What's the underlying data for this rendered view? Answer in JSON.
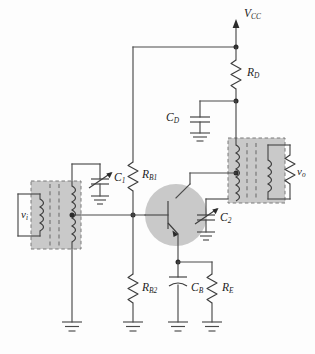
{
  "diagram": {
    "type": "electronic-circuit-schematic",
    "background_color": "#fdfdfd",
    "wire_color": "#4a4a4a",
    "shade_color": "#c9c9c9"
  },
  "labels": {
    "supply": {
      "base": "V",
      "sub": "CC"
    },
    "rd": {
      "base": "R",
      "sub": "D"
    },
    "cd": {
      "base": "C",
      "sub": "D"
    },
    "rb1": {
      "base": "R",
      "sub": "B1"
    },
    "rb2": {
      "base": "R",
      "sub": "B2"
    },
    "re": {
      "base": "R",
      "sub": "E"
    },
    "cb": {
      "base": "C",
      "sub": "B"
    },
    "c1": {
      "base": "C",
      "sub": "1"
    },
    "c2": {
      "base": "C",
      "sub": "2"
    },
    "vi": {
      "base": "v",
      "sub": "i"
    },
    "vo": {
      "base": "v",
      "sub": "o"
    }
  },
  "components": [
    {
      "id": "supply-rail",
      "name": "VCC supply rail",
      "kind": "supply-arrow"
    },
    {
      "id": "rd",
      "name": "RD collector load resistor",
      "kind": "resistor"
    },
    {
      "id": "cd",
      "name": "CD decoupling capacitor",
      "kind": "capacitor"
    },
    {
      "id": "rb1",
      "name": "RB1 upper bias resistor",
      "kind": "resistor"
    },
    {
      "id": "rb2",
      "name": "RB2 lower bias resistor",
      "kind": "resistor"
    },
    {
      "id": "re",
      "name": "RE emitter resistor",
      "kind": "resistor"
    },
    {
      "id": "cb",
      "name": "CB emitter bypass capacitor",
      "kind": "capacitor-polarized"
    },
    {
      "id": "c1",
      "name": "C1 input tuning capacitor",
      "kind": "variable-capacitor"
    },
    {
      "id": "c2",
      "name": "C2 output tuning capacitor",
      "kind": "variable-capacitor"
    },
    {
      "id": "q1",
      "name": "NPN bipolar junction transistor",
      "kind": "transistor-npn"
    },
    {
      "id": "t1",
      "name": "Input transformer",
      "kind": "transformer"
    },
    {
      "id": "t2",
      "name": "Output transformer",
      "kind": "transformer"
    },
    {
      "id": "rl",
      "name": "Output load resistor",
      "kind": "resistor"
    }
  ],
  "grounds": [
    {
      "id": "gnd-c1",
      "name": "C1 ground"
    },
    {
      "id": "gnd-t1",
      "name": "input transformer ground"
    },
    {
      "id": "gnd-rb2",
      "name": "RB2 ground"
    },
    {
      "id": "gnd-cb",
      "name": "CB ground"
    },
    {
      "id": "gnd-re",
      "name": "RE ground"
    },
    {
      "id": "gnd-cd",
      "name": "CD ground"
    },
    {
      "id": "gnd-c2",
      "name": "C2 ground"
    }
  ]
}
